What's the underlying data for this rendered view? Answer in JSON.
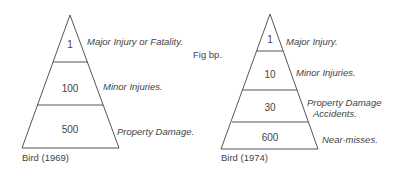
{
  "figure_label": "Fig bp.",
  "pyramids": [
    {
      "caption": "Bird (1969)",
      "tiers": [
        {
          "value": "1",
          "label": "Major Injury or Fatality."
        },
        {
          "value": "100",
          "label": "Minor Injuries."
        },
        {
          "value": "500",
          "label": "Property Damage."
        }
      ]
    },
    {
      "caption": "Bird (1974)",
      "tiers": [
        {
          "value": "1",
          "label": "Major Injury."
        },
        {
          "value": "10",
          "label": "Minor Injuries."
        },
        {
          "value": "30",
          "label": "Property Damage",
          "label2": "Accidents."
        },
        {
          "value": "600",
          "label": "Near-misses."
        }
      ]
    }
  ]
}
